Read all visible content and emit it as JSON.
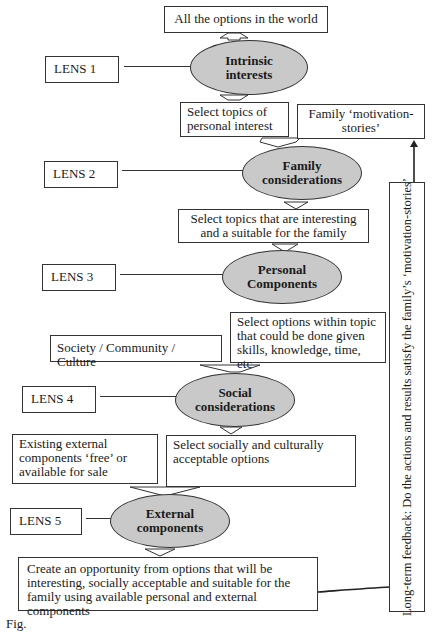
{
  "diagram": {
    "top_box": "All the options in the world",
    "lenses": [
      {
        "label": "LENS 1",
        "ellipse": [
          "Intrinsic",
          "interests"
        ]
      },
      {
        "label": "LENS 2",
        "ellipse": [
          "Family",
          "considerations"
        ]
      },
      {
        "label": "LENS 3",
        "ellipse": [
          "Personal",
          "Components"
        ]
      },
      {
        "label": "LENS 4",
        "ellipse": [
          "Social",
          "considerations"
        ]
      },
      {
        "label": "LENS 5",
        "ellipse": [
          "External",
          "components"
        ]
      }
    ],
    "boxes": {
      "personal_interest": "Select topics of personal interest",
      "motivation_stories": "Family ‘motivation-stories’",
      "interesting_suitable": "Select topics that are interesting and a suitable for the family",
      "options_within_topic": "Select options within topic that could be done given skills, knowledge, time, etc",
      "society": "Society / Community / Culture",
      "existing_external": "Existing external components ‘free’ or available for sale",
      "socially_acceptable": "Select socially and culturally acceptable options",
      "create_opportunity": "Create an opportunity from options that will be interesting, socially acceptable and suitable for the family using available personal and external components",
      "feedback": "Long-term feedback: Do the actions and results satisfy the family’s ‘motivation-stories’"
    },
    "caption": "Fig."
  },
  "colors": {
    "ellipse_fill": "#c9c9c9",
    "stroke": "#333333"
  }
}
